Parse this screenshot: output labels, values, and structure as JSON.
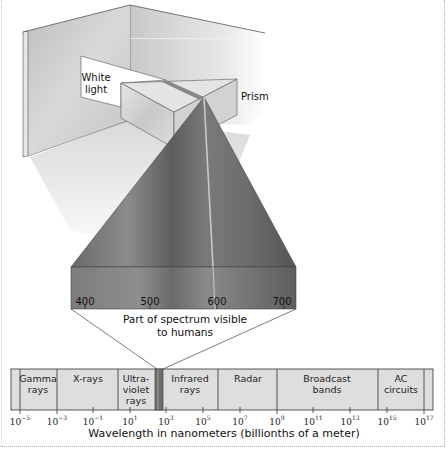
{
  "labels": {
    "white_light": "White light",
    "prism": "Prism",
    "visible_caption_line1": "Part of spectrum visible",
    "visible_caption_line2": "to humans",
    "axis_title": "Wavelength in nanometers (billionths of a meter)"
  },
  "visible_scale": {
    "ticks": [
      {
        "label": "400",
        "x": 85
      },
      {
        "label": "500",
        "x": 150
      },
      {
        "label": "600",
        "x": 217
      },
      {
        "label": "700",
        "x": 284
      }
    ]
  },
  "spectrum_bands": [
    {
      "name": "Gamma rays",
      "line1": "Gamma",
      "line2": "rays",
      "line3": "",
      "center_x": 38
    },
    {
      "name": "X-rays",
      "line1": "X-rays",
      "line2": "",
      "line3": "",
      "center_x": 88
    },
    {
      "name": "Ultraviolet rays",
      "line1": "Ultra-",
      "line2": "violet",
      "line3": "rays",
      "center_x": 136
    },
    {
      "name": "Infrared rays",
      "line1": "Infrared",
      "line2": "rays",
      "line3": "",
      "center_x": 190
    },
    {
      "name": "Radar",
      "line1": "Radar",
      "line2": "",
      "line3": "",
      "center_x": 248
    },
    {
      "name": "Broadcast bands",
      "line1": "Broadcast",
      "line2": "bands",
      "line3": "",
      "center_x": 327
    },
    {
      "name": "AC circuits",
      "line1": "AC",
      "line2": "circuits",
      "line3": "",
      "center_x": 401
    }
  ],
  "axis_ticks": [
    {
      "base": "10",
      "exp": "−5",
      "x": 20
    },
    {
      "base": "10",
      "exp": "−3",
      "x": 57
    },
    {
      "base": "10",
      "exp": "−1",
      "x": 93
    },
    {
      "base": "10",
      "exp": "1",
      "x": 130
    },
    {
      "base": "10",
      "exp": "3",
      "x": 166
    },
    {
      "base": "10",
      "exp": "5",
      "x": 203
    },
    {
      "base": "10",
      "exp": "7",
      "x": 240
    },
    {
      "base": "10",
      "exp": "9",
      "x": 277
    },
    {
      "base": "10",
      "exp": "11",
      "x": 313
    },
    {
      "base": "10",
      "exp": "13",
      "x": 350
    },
    {
      "base": "10",
      "exp": "15",
      "x": 387
    },
    {
      "base": "10",
      "exp": "17",
      "x": 424
    }
  ],
  "colors": {
    "band_fill": "#dedede",
    "band_border": "#333333",
    "beam_dark": "#555555",
    "beam_light": "#8a8a8a",
    "wall": "#cfcfcf"
  }
}
